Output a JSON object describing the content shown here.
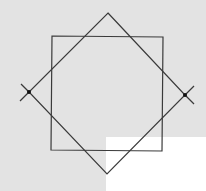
{
  "diagram": {
    "title": "",
    "background": {
      "gray": "#e3e3e3",
      "white": "#ffffff"
    },
    "stroke_color": "#3a3a3a",
    "shapes": {
      "square": {
        "label": "",
        "points": [
          [
            52,
            36
          ],
          [
            163,
            37
          ],
          [
            162,
            151
          ],
          [
            51,
            150
          ]
        ]
      },
      "diamond": {
        "label": "",
        "points": [
          [
            108,
            13
          ],
          [
            185,
            95
          ],
          [
            107,
            174
          ],
          [
            29,
            92
          ]
        ]
      }
    },
    "marked_points": [
      {
        "name": "left-vertex",
        "x": 29,
        "y": 92
      },
      {
        "name": "right-vertex",
        "x": 185,
        "y": 95
      }
    ]
  }
}
